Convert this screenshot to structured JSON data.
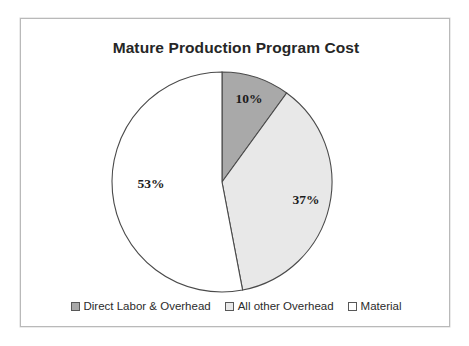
{
  "chart_data": {
    "type": "pie",
    "title": "Mature Production Program Cost",
    "categories": [
      "Direct Labor & Overhead",
      "All other Overhead",
      "Material"
    ],
    "values": [
      10,
      37,
      53
    ],
    "value_labels": [
      "10%",
      "37%",
      "53%"
    ],
    "units": "percent",
    "total": 100,
    "start_angle_deg": 0,
    "direction": "clockwise",
    "legend_position": "bottom",
    "grid": false,
    "xlabel": "",
    "ylabel": "",
    "slice_colors": [
      "#a9a9a9",
      "#e8e8e8",
      "#ffffff"
    ],
    "slice_outline_color": "#4a4a4a",
    "slices": [
      {
        "label": "Direct Labor & Overhead",
        "value": 10,
        "value_label": "10%",
        "color": "#a9a9a9"
      },
      {
        "label": "All other Overhead",
        "value": 37,
        "value_label": "37%",
        "color": "#e8e8e8"
      },
      {
        "label": "Material",
        "value": 53,
        "value_label": "53%",
        "color": "#ffffff"
      }
    ]
  },
  "frame": {
    "border_color": "#b9b9b9",
    "background": "#ffffff"
  },
  "legend": {
    "items": [
      {
        "label": "Direct Labor & Overhead",
        "color": "#a9a9a9"
      },
      {
        "label": "All other Overhead",
        "color": "#e8e8e8"
      },
      {
        "label": "Material",
        "color": "#ffffff"
      }
    ]
  }
}
